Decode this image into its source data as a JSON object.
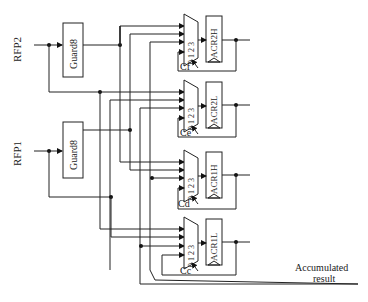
{
  "inputs": {
    "rfp2": "RFP2",
    "rfp1": "RFP1"
  },
  "guards": [
    {
      "label": "Guard8"
    },
    {
      "label": "Guard8"
    }
  ],
  "blocks": [
    {
      "register": "ACR2H",
      "control": "Cf",
      "mux_inputs": [
        "0",
        "1",
        "2",
        "3"
      ]
    },
    {
      "register": "ACR2L",
      "control": "Ce",
      "mux_inputs": [
        "0",
        "1",
        "2",
        "3"
      ]
    },
    {
      "register": "ACR1H",
      "control": "Cd",
      "mux_inputs": [
        "0",
        "1",
        "2",
        "3"
      ]
    },
    {
      "register": "ACR1L",
      "control": "Cc",
      "mux_inputs": [
        "0",
        "1",
        "2",
        "3"
      ]
    }
  ],
  "output": {
    "line1": "Accumulated",
    "line2": "result"
  }
}
